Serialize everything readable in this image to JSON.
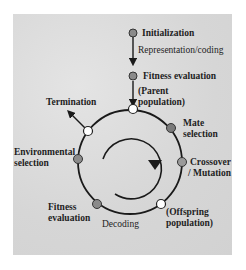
{
  "diagram": {
    "type": "evolutionary-algorithm-cycle",
    "colors": {
      "background_panel": "#d8d8d8",
      "line": "#1a1a1a",
      "node_gray": "#8a8a8a",
      "node_white": "#ffffff",
      "text": "#1e1e1e"
    },
    "entry": {
      "initialization": "Initialization",
      "representation": "Representation/coding",
      "fitness_evaluation": "Fitness evaluation",
      "parent_population_1": "(Parent",
      "parent_population_2": "population)"
    },
    "cycle_labels": {
      "termination": "Termination",
      "mate_selection_1": "Mate",
      "mate_selection_2": "selection",
      "crossover_1": "Crossover",
      "crossover_2": "/ Mutation",
      "offspring_1": "(Offspring",
      "offspring_2": "population)",
      "decoding": "Decoding",
      "fitness_eval_1": "Fitness",
      "fitness_eval_2": "evaluation",
      "env_selection_1": "Environmental",
      "env_selection_2": "selection"
    },
    "nodes": [
      {
        "name": "initialization",
        "fill": "gray"
      },
      {
        "name": "fitness-evaluation-entry",
        "fill": "gray"
      },
      {
        "name": "parent-population",
        "fill": "white"
      },
      {
        "name": "mate-selection",
        "fill": "gray"
      },
      {
        "name": "crossover-mutation",
        "fill": "gray"
      },
      {
        "name": "offspring-population",
        "fill": "white"
      },
      {
        "name": "fitness-evaluation",
        "fill": "gray"
      },
      {
        "name": "environmental-selection",
        "fill": "gray"
      },
      {
        "name": "termination",
        "fill": "white"
      }
    ],
    "center_arrow": "clockwise"
  }
}
